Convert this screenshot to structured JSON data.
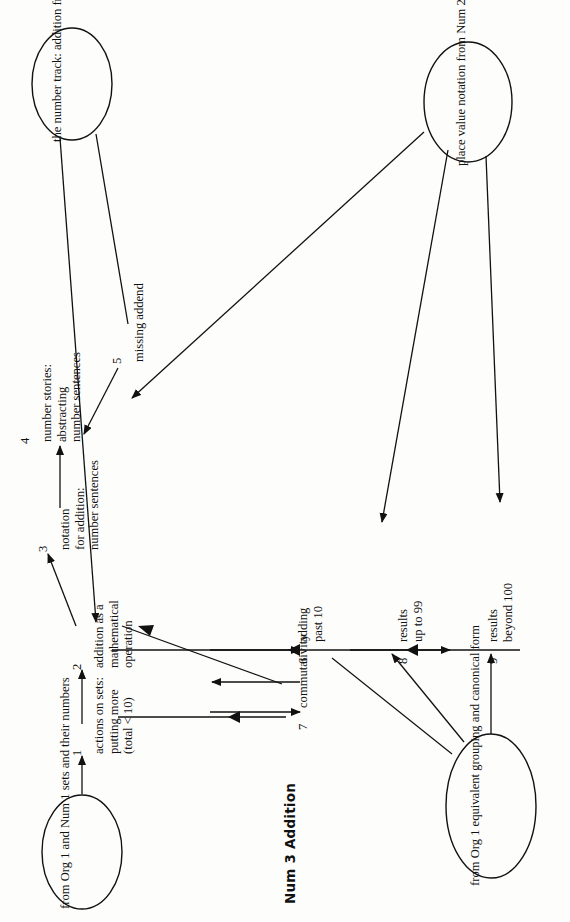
{
  "figure": {
    "title": "Num 3   Addition",
    "title_prefix": "Num 3",
    "title_name": "Addition",
    "orientation": "rotated-90-ccw",
    "ink_color": "#111111",
    "paper_color": "#fdfdfb"
  },
  "ellipses": [
    {
      "id": "ellipse-equivalent-grouping",
      "lines": [
        "from Org 1",
        "equivalent grouping",
        "and canonical form"
      ]
    },
    {
      "id": "ellipse-place-value",
      "lines": [
        "place value notation",
        "from Num 2"
      ]
    },
    {
      "id": "ellipse-sets-and-numbers",
      "lines": [
        "from Org 1",
        "and Num 1",
        "sets and",
        "their numbers"
      ]
    },
    {
      "id": "ellipse-number-track",
      "lines": [
        "the number",
        "track: addition",
        "from NuSp 1"
      ]
    }
  ],
  "nodes": [
    {
      "number": "1",
      "id": "node-actions-on-sets",
      "lines": [
        "actions on sets:",
        "putting more",
        "(total < 10)"
      ]
    },
    {
      "number": "2",
      "id": "node-addition-operation",
      "lines": [
        "addition as a",
        "mathematical",
        "operation"
      ]
    },
    {
      "number": "3",
      "id": "node-notation-for-addition",
      "lines": [
        "notation",
        "for addition:",
        "number sentences"
      ]
    },
    {
      "number": "4",
      "id": "node-number-stories",
      "lines": [
        "number stories:",
        "abstracting",
        "number sentences"
      ]
    },
    {
      "number": "5",
      "id": "node-missing-addend",
      "lines": [
        "missing addend"
      ]
    },
    {
      "number": "6",
      "id": "node-adding-past-10",
      "lines": [
        "adding",
        "past 10"
      ]
    },
    {
      "number": "7",
      "id": "node-commutativity",
      "lines": [
        "commutativity"
      ]
    },
    {
      "number": "8",
      "id": "node-results-up-to-99",
      "lines": [
        "results",
        "up to 99"
      ]
    },
    {
      "number": "9",
      "id": "node-results-beyond-100",
      "lines": [
        "results",
        "beyond 100"
      ]
    }
  ]
}
